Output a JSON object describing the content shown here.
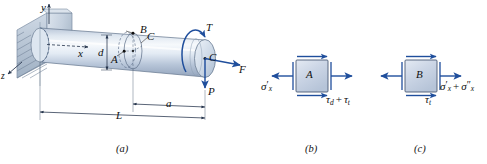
{
  "figure": {
    "panels": [
      {
        "id": "a",
        "caption": "(a)",
        "description": "cantilever round shaft fixed in wall with end loads"
      },
      {
        "id": "b",
        "caption": "(b)",
        "description": "stress element at point A"
      },
      {
        "id": "c",
        "caption": "(c)",
        "description": "stress element at point B"
      }
    ]
  },
  "beam": {
    "axes": {
      "y": "y",
      "x": "x",
      "z": "z"
    },
    "points": {
      "a": "A",
      "b": "B",
      "c_section": "C",
      "c_end": "C"
    },
    "diameter_label": "d",
    "dimensions": {
      "length": "L",
      "offset": "a"
    },
    "loads": {
      "torque": "T",
      "axial_force": "F",
      "transverse_force": "P"
    }
  },
  "element_a": {
    "label": "A",
    "normal_stress": {
      "symbol": "σ",
      "sub": "x",
      "primes": "′"
    },
    "shear_stress_terms": [
      {
        "symbol": "τ",
        "sub": "d"
      },
      {
        "symbol": "τ",
        "sub": "t"
      }
    ],
    "shear_operator": "+"
  },
  "element_b": {
    "label": "B",
    "normal_stress_terms": [
      {
        "symbol": "σ",
        "sub": "x",
        "primes": "′"
      },
      {
        "symbol": "σ",
        "sub": "x",
        "primes": "″"
      }
    ],
    "normal_operator": "+",
    "shear_stress": {
      "symbol": "τ",
      "sub": "t"
    }
  },
  "colors": {
    "arrow_blue": "#1f4e9c",
    "shaft_outline": "#5a6b84",
    "element_fill": "#ccd6e6",
    "element_stroke": "#4a5a75",
    "wall_fill": "#c2cedd"
  }
}
